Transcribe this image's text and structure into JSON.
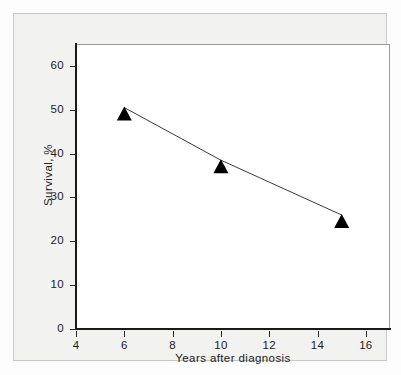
{
  "chart_data": {
    "type": "line",
    "title": "",
    "xlabel": "Years after diagnosis",
    "ylabel": "Survival, %",
    "xlim": [
      4,
      17
    ],
    "ylim": [
      0,
      65
    ],
    "grid": false,
    "legend": "none",
    "marker": "filled-triangle",
    "marker_color": "#000000",
    "line_color": "#3a3a3a",
    "x": [
      6,
      10,
      15
    ],
    "values": [
      50.5,
      38.5,
      26
    ],
    "points": [
      {
        "x": 6,
        "y": 50.5
      },
      {
        "x": 10,
        "y": 38.5
      },
      {
        "x": 15,
        "y": 26
      }
    ],
    "xticks": [
      4,
      6,
      8,
      10,
      12,
      14,
      16
    ],
    "xtick_labels": [
      "4",
      "6",
      "8",
      "10",
      "12",
      "14",
      "16"
    ],
    "yticks": [
      0,
      10,
      20,
      30,
      40,
      50,
      60
    ],
    "ytick_labels": [
      "0",
      "10",
      "20",
      "30",
      "40",
      "50",
      "60"
    ]
  },
  "figure": {
    "background_color": "#f2f2f0",
    "panel_color": "#ffffff",
    "axis_color": "#1a1a1a",
    "frame_color": "#c9c9c7"
  }
}
